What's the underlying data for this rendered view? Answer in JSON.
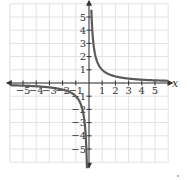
{
  "chart_data": {
    "type": "line",
    "title": "",
    "xlabel": "x",
    "ylabel": "y",
    "xlim": [
      -6,
      6
    ],
    "ylim": [
      -6,
      6
    ],
    "grid": true,
    "x_ticks": [
      "-5",
      "-4",
      "-3",
      "-2",
      "-1",
      "1",
      "2",
      "3",
      "4",
      "5"
    ],
    "y_ticks": [
      "5",
      "4",
      "3",
      "2",
      "1",
      "-1",
      "-2",
      "-3",
      "-4",
      "-5"
    ],
    "series": [
      {
        "name": "y = 1/x",
        "function": "1/x",
        "branches": [
          {
            "x": [
              0.18,
              0.25,
              0.5,
              1,
              2,
              3,
              4,
              5.5
            ],
            "y": [
              5.5,
              4,
              2,
              1,
              0.5,
              0.333,
              0.25,
              0.18
            ]
          },
          {
            "x": [
              -5.5,
              -4,
              -3,
              -2,
              -1,
              -0.5,
              -0.25,
              -0.18
            ],
            "y": [
              -0.18,
              -0.25,
              -0.333,
              -0.5,
              -1,
              -2,
              -4,
              -5.5
            ]
          }
        ],
        "color": "#555555"
      }
    ],
    "legend": null
  },
  "axes": {
    "x_label": "x",
    "y_label": "y"
  },
  "colors": {
    "grid": "#e2e2e2",
    "axis": "#333333",
    "curve": "#5a5a5a"
  }
}
